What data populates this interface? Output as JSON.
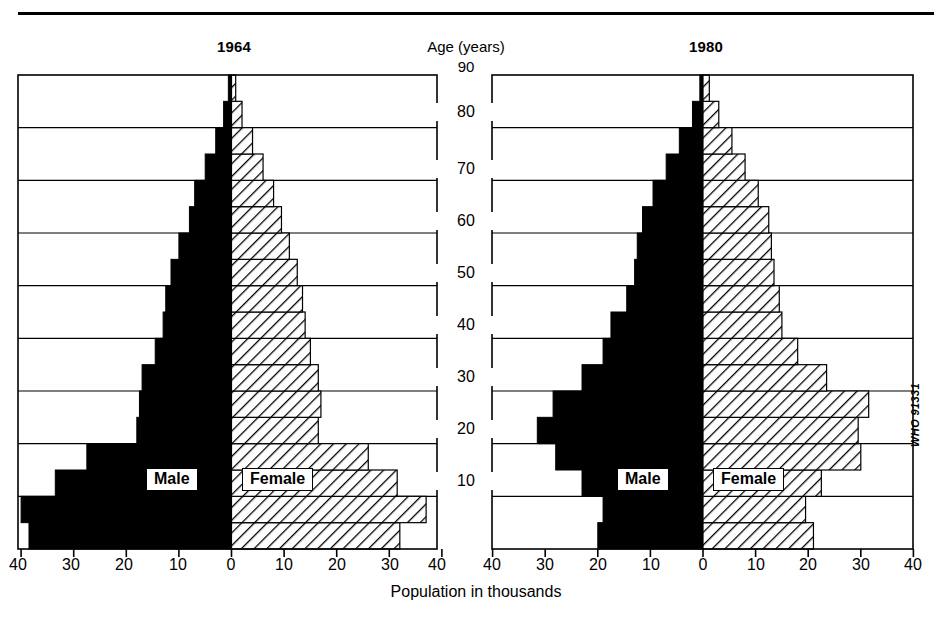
{
  "figure": {
    "left_title": "1964",
    "right_title": "1980",
    "age_axis_title": "Age (years)",
    "age_axis_top_value": "90",
    "x_axis_title": "Population in thousands",
    "credit": "WHO 91331",
    "male_legend": "Male",
    "female_legend": "Female",
    "ink_color": "#000000",
    "paper_color": "#ffffff"
  },
  "chart_data": {
    "type": "bar",
    "subtype": "population-pyramid",
    "title": "",
    "xlabel": "Population in thousands",
    "ylabel": "Age (years)",
    "xlim": [
      0,
      40
    ],
    "ylim": [
      0,
      90
    ],
    "grid": true,
    "legend": [
      "Male",
      "Female"
    ],
    "legend_position": "inside-center",
    "x_tick_labels": [
      "40",
      "30",
      "20",
      "10",
      "0",
      "10",
      "20",
      "30",
      "40"
    ],
    "x_tick_values": [
      40,
      30,
      20,
      10,
      0,
      10,
      20,
      30,
      40
    ],
    "y_tick_labels": [
      "10",
      "20",
      "30",
      "40",
      "50",
      "60",
      "70",
      "80",
      "90"
    ],
    "y_tick_values": [
      10,
      20,
      30,
      40,
      50,
      60,
      70,
      80,
      90
    ],
    "age_groups": [
      "0-4",
      "5-9",
      "10-14",
      "15-19",
      "20-24",
      "25-29",
      "30-34",
      "35-39",
      "40-44",
      "45-49",
      "50-54",
      "55-59",
      "60-64",
      "65-69",
      "70-74",
      "75-79",
      "80-84",
      "85+"
    ],
    "age_group_lower": [
      0,
      5,
      10,
      15,
      20,
      25,
      30,
      35,
      40,
      45,
      50,
      55,
      60,
      65,
      70,
      75,
      80,
      85
    ],
    "panels": [
      {
        "name": "1964",
        "label": "1964",
        "series": [
          {
            "name": "Male",
            "values": [
              38.5,
              40.0,
              33.5,
              27.5,
              18.0,
              17.5,
              17.0,
              14.5,
              13.0,
              12.5,
              11.5,
              10.0,
              8.0,
              7.0,
              5.0,
              3.0,
              1.5,
              0.6
            ]
          },
          {
            "name": "Female",
            "values": [
              32.0,
              37.0,
              31.5,
              26.0,
              16.5,
              17.0,
              16.5,
              15.0,
              14.0,
              13.5,
              12.5,
              11.0,
              9.5,
              8.0,
              6.0,
              4.0,
              2.0,
              0.8
            ]
          }
        ]
      },
      {
        "name": "1980",
        "label": "1980",
        "series": [
          {
            "name": "Male",
            "values": [
              20.0,
              19.0,
              23.0,
              28.0,
              31.5,
              28.5,
              23.0,
              19.0,
              17.5,
              14.5,
              13.0,
              12.5,
              11.5,
              9.5,
              7.0,
              4.5,
              2.0,
              0.6
            ]
          },
          {
            "name": "Female",
            "values": [
              21.0,
              19.5,
              22.5,
              30.0,
              29.5,
              31.5,
              23.5,
              18.0,
              15.0,
              14.5,
              13.5,
              13.0,
              12.5,
              10.5,
              8.0,
              5.5,
              3.0,
              1.2
            ]
          }
        ]
      }
    ]
  },
  "x_ticks_rendered": [
    {
      "label": "40",
      "x": 18
    },
    {
      "label": "30",
      "x": 71
    },
    {
      "label": "20",
      "x": 124
    },
    {
      "label": "10",
      "x": 178
    },
    {
      "label": "0",
      "x": 231
    },
    {
      "label": "10",
      "x": 284
    },
    {
      "label": "20",
      "x": 337
    },
    {
      "label": "30",
      "x": 390
    },
    {
      "label": "40",
      "x": 437
    },
    {
      "label": "40",
      "x": 492
    },
    {
      "label": "30",
      "x": 545
    },
    {
      "label": "20",
      "x": 598
    },
    {
      "label": "10",
      "x": 651
    },
    {
      "label": "0",
      "x": 703
    },
    {
      "label": "10",
      "x": 756
    },
    {
      "label": "20",
      "x": 808
    },
    {
      "label": "30",
      "x": 861
    },
    {
      "label": "40",
      "x": 913
    }
  ],
  "age_labels_rendered": [
    {
      "label": "80",
      "y": 113
    },
    {
      "label": "70",
      "y": 170
    },
    {
      "label": "60",
      "y": 222
    },
    {
      "label": "50",
      "y": 274
    },
    {
      "label": "40",
      "y": 326
    },
    {
      "label": "30",
      "y": 378
    },
    {
      "label": "20",
      "y": 430
    },
    {
      "label": "10",
      "y": 482
    }
  ]
}
